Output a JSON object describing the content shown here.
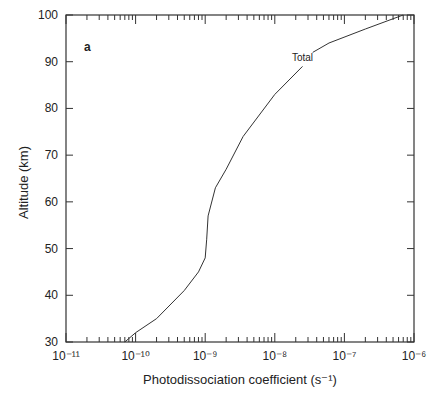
{
  "chart_data": {
    "type": "line",
    "title": "",
    "panel_label": "a",
    "xlabel": "Photodissociation coefficient (s⁻¹)",
    "ylabel": "Altitude (km)",
    "xscale": "log",
    "xlim": [
      1e-11,
      1e-06
    ],
    "ylim": [
      30,
      100
    ],
    "x_tick_labels": [
      "10⁻¹¹",
      "10⁻¹⁰",
      "10⁻⁹",
      "10⁻⁸",
      "10⁻⁷",
      "10⁻⁶"
    ],
    "y_tick_labels": [
      "30",
      "40",
      "50",
      "60",
      "70",
      "80",
      "90",
      "100"
    ],
    "grid": false,
    "series": [
      {
        "name": "Total",
        "x": [
          7e-11,
          1e-10,
          2e-10,
          5e-10,
          8e-10,
          1e-09,
          1.05e-09,
          1.1e-09,
          1.4e-09,
          2e-09,
          3.5e-09,
          1e-08,
          2.5e-08,
          3.5e-08,
          6e-08,
          2e-07,
          7e-07
        ],
        "y": [
          30,
          32,
          35,
          41,
          45,
          48,
          52,
          57,
          63,
          67,
          74,
          83,
          89,
          92,
          94,
          97,
          100
        ]
      }
    ],
    "annotations": [
      {
        "text": "Total",
        "x": 2.5e-08,
        "y": 91
      }
    ]
  }
}
